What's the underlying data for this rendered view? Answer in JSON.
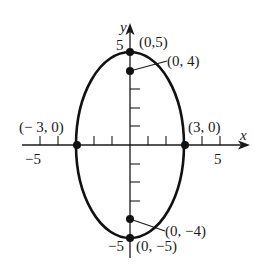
{
  "figure": {
    "type": "ellipse-graph",
    "equation_hint": "x^2/9 + y^2/25 = 1",
    "axes": {
      "x_label": "x",
      "y_label": "y",
      "x_tick_labels": [
        "−5",
        "5"
      ],
      "y_tick_labels": [
        "5",
        "−5"
      ],
      "x_range": [
        -5,
        5
      ],
      "y_range": [
        -5,
        5
      ],
      "tick_step": 1
    },
    "ellipse": {
      "center": [
        0,
        0
      ],
      "semi_major": 5,
      "semi_minor": 3,
      "major_axis": "vertical"
    },
    "points": [
      {
        "label": "(0,5)",
        "x": 0,
        "y": 5,
        "role": "vertex"
      },
      {
        "label": "(0, 4)",
        "x": 0,
        "y": 4,
        "role": "focus"
      },
      {
        "label": "(− 3, 0)",
        "x": -3,
        "y": 0,
        "role": "co-vertex"
      },
      {
        "label": "(3, 0)",
        "x": 3,
        "y": 0,
        "role": "co-vertex"
      },
      {
        "label": "(0, −4)",
        "x": 0,
        "y": -4,
        "role": "focus"
      },
      {
        "label": "(0, −5)",
        "x": 0,
        "y": -5,
        "role": "vertex"
      }
    ],
    "colors": {
      "ink": "#1a1a1a",
      "background": "#ffffff"
    }
  }
}
